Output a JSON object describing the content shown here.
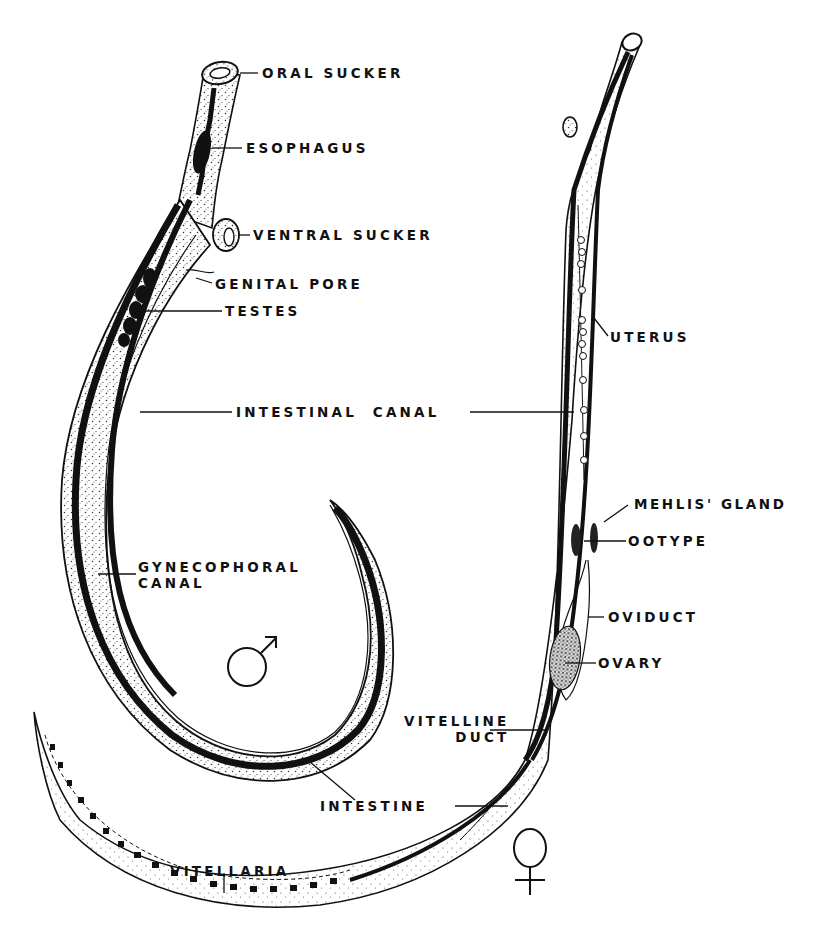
{
  "figure": {
    "colors": {
      "ink": "#111111",
      "paper": "#ffffff",
      "stipple": "#333333"
    }
  },
  "male": {
    "symbol": "♂",
    "labels": {
      "oral_sucker": "ORAL SUCKER",
      "esophagus": "ESOPHAGUS",
      "ventral_sucker": "VENTRAL SUCKER",
      "genital_pore": "GENITAL PORE",
      "testes": "TESTES",
      "intestinal_canal": "INTESTINAL  CANAL",
      "gynecophoral_canal_line1": "GYNECOPHORAL",
      "gynecophoral_canal_line2": "CANAL",
      "intestine": "INTESTINE"
    }
  },
  "female": {
    "symbol": "♀",
    "labels": {
      "uterus": "UTERUS",
      "mehlis_gland": "MEHLIS' GLAND",
      "ootype": "OOTYPE",
      "oviduct": "OVIDUCT",
      "ovary": "OVARY",
      "vitelline_duct_line1": "VITELLINE",
      "vitelline_duct_line2": "DUCT",
      "vitellaria": "VITELLARIA"
    }
  }
}
